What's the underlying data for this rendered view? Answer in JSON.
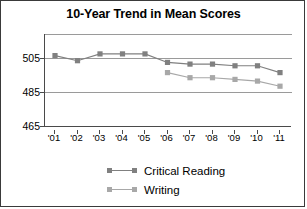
{
  "chart_data": {
    "type": "line",
    "title": "10-Year Trend in Mean Scores",
    "xlabel": "",
    "ylabel": "",
    "categories": [
      "'01",
      "'02",
      "'03",
      "'04",
      "'05",
      "'06",
      "'07",
      "'08",
      "'09",
      "'10",
      "'11"
    ],
    "ylim": [
      465,
      525
    ],
    "yticks": [
      465,
      485,
      505
    ],
    "grid": "horizontal",
    "legend_position": "bottom",
    "series": [
      {
        "name": "Critical Reading",
        "color": "#808080",
        "marker": "square",
        "values": [
          507,
          504,
          508,
          508,
          508,
          503,
          502,
          502,
          501,
          501,
          497
        ]
      },
      {
        "name": "Writing",
        "color": "#a8a8a8",
        "marker": "square",
        "values": [
          null,
          null,
          null,
          null,
          null,
          497,
          494,
          494,
          493,
          492,
          489
        ]
      }
    ]
  },
  "figure": {
    "title": "10-Year Trend in Mean Scores",
    "y_axis_labels": [
      "505",
      "485",
      "465"
    ],
    "x_axis_labels": [
      "'01",
      "'02",
      "'03",
      "'04",
      "'05",
      "'06",
      "'07",
      "'08",
      "'09",
      "'10",
      "'11"
    ],
    "legend": [
      {
        "label": "Critical Reading",
        "color": "#808080"
      },
      {
        "label": "Writing",
        "color": "#a8a8a8"
      }
    ]
  }
}
